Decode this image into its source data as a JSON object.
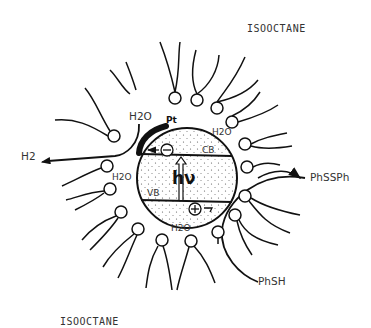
{
  "figure": {
    "labels": {
      "solvent_top": "ISOOCTANE",
      "solvent_bottom": "ISOOCTANE",
      "h2_product": "H2",
      "water_top_left": "H2O",
      "water_left": "H2O",
      "water_right": "H2O",
      "water_bottom": "H2O",
      "platinum": "Pt",
      "conduction_band": "CB",
      "valence_band": "VB",
      "photon": "hν",
      "electron_symbol": "⊖",
      "hole_symbol": "⊕",
      "product_disulfide": "PhSSPh",
      "reactant_thiol": "PhSH"
    },
    "colors": {
      "ink": "#111111",
      "text": "#333333",
      "background": "#ffffff"
    }
  }
}
